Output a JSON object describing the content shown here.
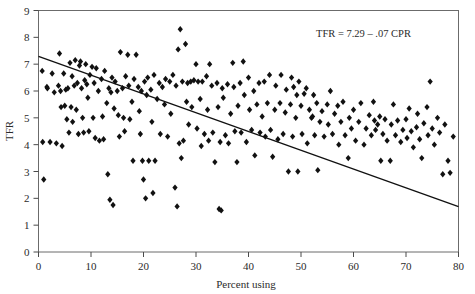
{
  "chart_data": {
    "type": "scatter",
    "title": "",
    "xlabel": "Percent using",
    "ylabel": "TFR",
    "xlim": [
      0,
      80
    ],
    "ylim": [
      0,
      9
    ],
    "xticks": [
      0,
      10,
      20,
      30,
      40,
      50,
      60,
      70,
      80
    ],
    "yticks": [
      0,
      1,
      2,
      3,
      4,
      5,
      6,
      7,
      8,
      9
    ],
    "grid": false,
    "legend": null,
    "annotations": [
      {
        "text": "TFR = 7.29 – .07 CPR",
        "x": 52.0,
        "y": 8.55
      }
    ],
    "fit_line": {
      "equation": "TFR = 7.29 - .07 CPR",
      "intercept": 7.29,
      "slope": -0.07,
      "x_start": 0,
      "x_end": 80,
      "y_start": 7.29,
      "y_end": 1.69
    },
    "marker": {
      "shape": "diamond",
      "color": "#111111",
      "size": 3.2
    },
    "points": [
      [
        0.7,
        6.75
      ],
      [
        0.8,
        4.1
      ],
      [
        1.0,
        2.7
      ],
      [
        1.6,
        6.15
      ],
      [
        1.7,
        6.1
      ],
      [
        2.2,
        4.1
      ],
      [
        2.6,
        6.65
      ],
      [
        3.0,
        5.95
      ],
      [
        3.4,
        4.05
      ],
      [
        3.8,
        6.2
      ],
      [
        4.0,
        7.4
      ],
      [
        4.2,
        6.0
      ],
      [
        4.3,
        5.4
      ],
      [
        4.5,
        3.95
      ],
      [
        4.8,
        6.65
      ],
      [
        5.0,
        5.45
      ],
      [
        5.2,
        6.05
      ],
      [
        5.4,
        4.95
      ],
      [
        5.6,
        6.1
      ],
      [
        5.8,
        4.45
      ],
      [
        6.0,
        7.05
      ],
      [
        6.2,
        5.4
      ],
      [
        6.4,
        6.55
      ],
      [
        6.5,
        4.85
      ],
      [
        6.8,
        6.2
      ],
      [
        7.0,
        7.15
      ],
      [
        7.2,
        5.3
      ],
      [
        7.4,
        6.3
      ],
      [
        7.6,
        4.4
      ],
      [
        7.8,
        6.95
      ],
      [
        8.0,
        7.1
      ],
      [
        8.2,
        6.1
      ],
      [
        8.4,
        5.0
      ],
      [
        8.6,
        4.45
      ],
      [
        8.8,
        6.4
      ],
      [
        9.0,
        7.0
      ],
      [
        9.2,
        6.25
      ],
      [
        9.4,
        5.75
      ],
      [
        9.6,
        4.5
      ],
      [
        9.8,
        6.6
      ],
      [
        10.2,
        6.9
      ],
      [
        10.4,
        5.0
      ],
      [
        10.6,
        6.3
      ],
      [
        10.8,
        4.25
      ],
      [
        11.0,
        6.85
      ],
      [
        11.4,
        6.0
      ],
      [
        11.6,
        4.15
      ],
      [
        12.0,
        6.45
      ],
      [
        12.2,
        5.05
      ],
      [
        12.4,
        4.2
      ],
      [
        12.6,
        6.75
      ],
      [
        13.0,
        5.55
      ],
      [
        13.2,
        2.9
      ],
      [
        13.4,
        6.1
      ],
      [
        13.6,
        1.95
      ],
      [
        13.8,
        5.95
      ],
      [
        14.0,
        6.5
      ],
      [
        14.2,
        1.75
      ],
      [
        14.4,
        5.35
      ],
      [
        14.6,
        6.35
      ],
      [
        15.0,
        6.0
      ],
      [
        15.2,
        5.1
      ],
      [
        15.4,
        4.3
      ],
      [
        15.6,
        7.45
      ],
      [
        16.0,
        6.1
      ],
      [
        16.2,
        5.0
      ],
      [
        16.4,
        4.5
      ],
      [
        16.6,
        6.55
      ],
      [
        17.0,
        7.35
      ],
      [
        17.2,
        6.2
      ],
      [
        17.4,
        4.95
      ],
      [
        17.8,
        5.6
      ],
      [
        18.0,
        3.4
      ],
      [
        18.2,
        6.45
      ],
      [
        18.6,
        7.35
      ],
      [
        19.0,
        6.15
      ],
      [
        19.2,
        5.25
      ],
      [
        19.4,
        4.4
      ],
      [
        19.6,
        6.0
      ],
      [
        19.8,
        3.4
      ],
      [
        20.0,
        2.7
      ],
      [
        20.2,
        6.35
      ],
      [
        20.4,
        2.0
      ],
      [
        20.6,
        5.85
      ],
      [
        20.8,
        6.5
      ],
      [
        21.0,
        3.4
      ],
      [
        21.4,
        6.05
      ],
      [
        21.6,
        4.85
      ],
      [
        21.8,
        2.2
      ],
      [
        22.0,
        6.6
      ],
      [
        22.2,
        3.4
      ],
      [
        22.6,
        5.7
      ],
      [
        23.0,
        6.3
      ],
      [
        23.2,
        4.4
      ],
      [
        23.6,
        6.15
      ],
      [
        24.0,
        5.5
      ],
      [
        24.2,
        6.45
      ],
      [
        24.6,
        4.3
      ],
      [
        25.0,
        6.35
      ],
      [
        25.2,
        5.15
      ],
      [
        25.6,
        6.6
      ],
      [
        26.0,
        2.4
      ],
      [
        26.2,
        6.2
      ],
      [
        26.4,
        1.7
      ],
      [
        26.6,
        7.55
      ],
      [
        26.8,
        4.05
      ],
      [
        27.0,
        8.3
      ],
      [
        27.2,
        3.5
      ],
      [
        27.4,
        6.35
      ],
      [
        27.6,
        4.15
      ],
      [
        28.0,
        7.75
      ],
      [
        28.2,
        5.6
      ],
      [
        28.4,
        6.3
      ],
      [
        28.6,
        4.75
      ],
      [
        29.0,
        6.35
      ],
      [
        29.2,
        5.4
      ],
      [
        29.6,
        6.4
      ],
      [
        30.0,
        7.0
      ],
      [
        30.2,
        4.6
      ],
      [
        30.4,
        6.35
      ],
      [
        30.8,
        5.7
      ],
      [
        31.0,
        3.95
      ],
      [
        31.2,
        6.35
      ],
      [
        31.6,
        4.4
      ],
      [
        32.0,
        6.55
      ],
      [
        32.2,
        5.3
      ],
      [
        32.4,
        4.15
      ],
      [
        32.6,
        7.0
      ],
      [
        33.0,
        6.2
      ],
      [
        33.2,
        4.45
      ],
      [
        33.6,
        3.35
      ],
      [
        34.0,
        6.3
      ],
      [
        34.2,
        5.4
      ],
      [
        34.4,
        1.6
      ],
      [
        34.6,
        4.1
      ],
      [
        34.8,
        1.55
      ],
      [
        35.0,
        6.1
      ],
      [
        35.2,
        5.75
      ],
      [
        35.6,
        4.35
      ],
      [
        36.0,
        6.25
      ],
      [
        36.2,
        4.05
      ],
      [
        36.6,
        5.15
      ],
      [
        37.0,
        7.05
      ],
      [
        37.2,
        6.15
      ],
      [
        37.4,
        4.5
      ],
      [
        37.8,
        3.35
      ],
      [
        38.0,
        5.45
      ],
      [
        38.4,
        6.3
      ],
      [
        38.6,
        4.45
      ],
      [
        39.0,
        7.1
      ],
      [
        39.2,
        5.85
      ],
      [
        39.6,
        4.1
      ],
      [
        40.0,
        6.5
      ],
      [
        40.2,
        5.3
      ],
      [
        40.6,
        4.55
      ],
      [
        41.0,
        6.0
      ],
      [
        41.2,
        3.6
      ],
      [
        41.6,
        5.5
      ],
      [
        42.0,
        6.3
      ],
      [
        42.2,
        4.45
      ],
      [
        42.6,
        5.05
      ],
      [
        43.0,
        6.35
      ],
      [
        43.2,
        4.3
      ],
      [
        43.6,
        5.55
      ],
      [
        44.0,
        6.6
      ],
      [
        44.2,
        4.55
      ],
      [
        44.6,
        3.55
      ],
      [
        45.0,
        5.3
      ],
      [
        45.2,
        6.2
      ],
      [
        45.6,
        4.2
      ],
      [
        46.0,
        5.55
      ],
      [
        46.2,
        6.6
      ],
      [
        46.6,
        4.4
      ],
      [
        47.0,
        5.2
      ],
      [
        47.2,
        6.05
      ],
      [
        47.6,
        3.0
      ],
      [
        48.0,
        5.5
      ],
      [
        48.2,
        6.5
      ],
      [
        48.4,
        4.3
      ],
      [
        48.6,
        6.15
      ],
      [
        49.0,
        5.0
      ],
      [
        49.2,
        5.85
      ],
      [
        49.4,
        3.0
      ],
      [
        49.6,
        6.35
      ],
      [
        50.0,
        5.45
      ],
      [
        50.2,
        4.4
      ],
      [
        50.6,
        5.9
      ],
      [
        51.0,
        6.1
      ],
      [
        51.2,
        4.05
      ],
      [
        51.6,
        5.3
      ],
      [
        52.0,
        5.0
      ],
      [
        52.2,
        5.05
      ],
      [
        52.4,
        5.85
      ],
      [
        52.6,
        4.35
      ],
      [
        53.0,
        5.55
      ],
      [
        53.2,
        3.05
      ],
      [
        53.6,
        4.85
      ],
      [
        54.0,
        5.25
      ],
      [
        54.4,
        4.3
      ],
      [
        55.0,
        5.5
      ],
      [
        55.2,
        4.75
      ],
      [
        55.6,
        6.0
      ],
      [
        56.0,
        4.4
      ],
      [
        56.4,
        5.15
      ],
      [
        57.0,
        5.45
      ],
      [
        57.2,
        4.0
      ],
      [
        57.6,
        4.85
      ],
      [
        58.0,
        5.6
      ],
      [
        58.4,
        4.35
      ],
      [
        59.0,
        3.5
      ],
      [
        59.2,
        5.0
      ],
      [
        59.6,
        4.6
      ],
      [
        60.0,
        5.3
      ],
      [
        60.4,
        4.15
      ],
      [
        61.0,
        4.85
      ],
      [
        61.4,
        5.55
      ],
      [
        62.0,
        4.0
      ],
      [
        62.4,
        4.6
      ],
      [
        63.0,
        5.1
      ],
      [
        63.4,
        4.35
      ],
      [
        63.8,
        5.6
      ],
      [
        64.0,
        4.9
      ],
      [
        64.2,
        4.55
      ],
      [
        64.6,
        4.75
      ],
      [
        65.0,
        5.05
      ],
      [
        65.2,
        3.4
      ],
      [
        65.6,
        4.4
      ],
      [
        66.0,
        4.95
      ],
      [
        66.4,
        4.15
      ],
      [
        67.0,
        3.4
      ],
      [
        67.2,
        4.75
      ],
      [
        67.6,
        5.5
      ],
      [
        68.0,
        4.35
      ],
      [
        68.4,
        4.9
      ],
      [
        69.0,
        4.1
      ],
      [
        69.4,
        4.55
      ],
      [
        70.0,
        4.95
      ],
      [
        70.2,
        4.25
      ],
      [
        70.6,
        5.35
      ],
      [
        71.0,
        4.5
      ],
      [
        71.4,
        3.9
      ],
      [
        72.0,
        4.65
      ],
      [
        72.2,
        5.15
      ],
      [
        72.6,
        4.2
      ],
      [
        73.0,
        3.5
      ],
      [
        73.4,
        4.8
      ],
      [
        74.0,
        5.4
      ],
      [
        74.2,
        4.35
      ],
      [
        74.6,
        6.35
      ],
      [
        75.0,
        4.6
      ],
      [
        75.4,
        4.0
      ],
      [
        76.0,
        5.0
      ],
      [
        76.4,
        4.45
      ],
      [
        77.0,
        2.9
      ],
      [
        77.4,
        4.75
      ],
      [
        78.0,
        3.4
      ],
      [
        78.4,
        2.95
      ],
      [
        79.0,
        4.3
      ]
    ]
  },
  "axes": {
    "y_title": "TFR",
    "x_title": "Percent using"
  }
}
